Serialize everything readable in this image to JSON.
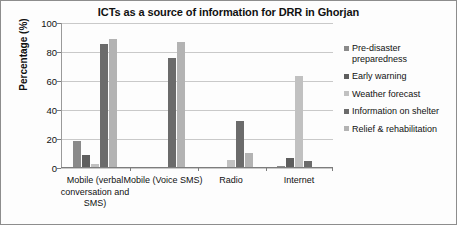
{
  "chart_data": {
    "type": "bar",
    "title": "ICTs as a source of information for DRR in Ghorjan",
    "xlabel": "",
    "ylabel": "Percentage (%)",
    "ylim": [
      0,
      100
    ],
    "yticks": [
      0,
      20,
      40,
      60,
      80,
      100
    ],
    "grid": true,
    "legend_position": "right",
    "categories": [
      "Mobile (verbal conversation and SMS)",
      "Mobile (Voice SMS)",
      "Radio",
      "Internet"
    ],
    "series": [
      {
        "name": "Pre-disaster preparedness",
        "color": "#8a8a8a",
        "values": [
          18,
          0,
          0,
          1
        ]
      },
      {
        "name": "Early warning",
        "color": "#5e5e5e",
        "values": [
          8,
          0,
          0,
          6
        ]
      },
      {
        "name": "Weather forecast",
        "color": "#c1c1c1",
        "values": [
          2,
          0,
          5,
          63
        ]
      },
      {
        "name": "Information on shelter",
        "color": "#6b6b6b",
        "values": [
          85,
          75,
          32,
          4
        ]
      },
      {
        "name": "Relief & rehabilitation",
        "color": "#b3b3b3",
        "values": [
          88,
          86,
          10,
          0
        ]
      }
    ]
  },
  "axis": {
    "y_title": "Percentage (%)",
    "y_tick_labels": [
      "100",
      "80",
      "60",
      "40",
      "20",
      "0"
    ]
  },
  "category_labels": [
    "Mobile (verbal conversation and SMS)",
    "Mobile (Voice SMS)",
    "Radio",
    "Internet"
  ],
  "legend": {
    "items": [
      {
        "label": "Pre-disaster preparedness",
        "color": "#8a8a8a"
      },
      {
        "label": "Early warning",
        "color": "#5e5e5e"
      },
      {
        "label": "Weather forecast",
        "color": "#c1c1c1"
      },
      {
        "label": "Information on shelter",
        "color": "#6b6b6b"
      },
      {
        "label": "Relief & rehabilitation",
        "color": "#b3b3b3"
      }
    ]
  }
}
